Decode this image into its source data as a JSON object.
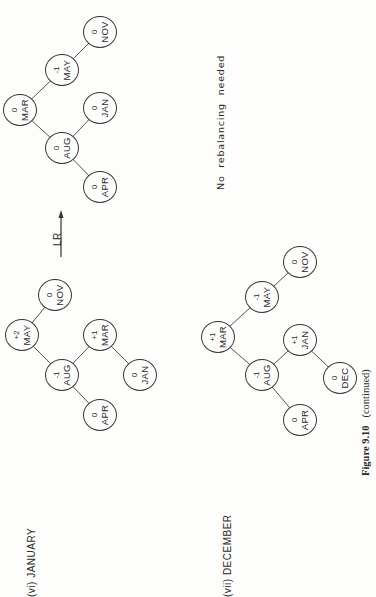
{
  "figure": {
    "caption_number": "Figure 9.10",
    "caption_text": "(continued)"
  },
  "sections": [
    {
      "label": "(vi) JANUARY",
      "tree_before": {
        "nodes": [
          {
            "key": "MAY",
            "balance": "+2"
          },
          {
            "key": "NOV",
            "balance": "0"
          },
          {
            "key": "AUG",
            "balance": "-1"
          },
          {
            "key": "MAR",
            "balance": "+1"
          },
          {
            "key": "APR",
            "balance": "0"
          },
          {
            "key": "JAN",
            "balance": "0"
          }
        ],
        "edges": [
          [
            "MAY",
            "AUG"
          ],
          [
            "MAY",
            "NOV"
          ],
          [
            "AUG",
            "APR"
          ],
          [
            "AUG",
            "MAR"
          ],
          [
            "MAR",
            "JAN"
          ]
        ]
      },
      "rotation": "LR",
      "tree_after": {
        "nodes": [
          {
            "key": "MAR",
            "balance": "0"
          },
          {
            "key": "MAY",
            "balance": "-1"
          },
          {
            "key": "NOV",
            "balance": "0"
          },
          {
            "key": "AUG",
            "balance": "0"
          },
          {
            "key": "JAN",
            "balance": "0"
          },
          {
            "key": "APR",
            "balance": "0"
          }
        ],
        "edges": [
          [
            "MAR",
            "AUG"
          ],
          [
            "MAR",
            "MAY"
          ],
          [
            "MAY",
            "NOV"
          ],
          [
            "AUG",
            "APR"
          ],
          [
            "AUG",
            "JAN"
          ]
        ]
      }
    },
    {
      "label": "(vii) DECEMBER",
      "tree": {
        "nodes": [
          {
            "key": "MAR",
            "balance": "+1"
          },
          {
            "key": "MAY",
            "balance": "-1"
          },
          {
            "key": "NOV",
            "balance": "0"
          },
          {
            "key": "AUG",
            "balance": "-1"
          },
          {
            "key": "JAN",
            "balance": "+1"
          },
          {
            "key": "APR",
            "balance": "0"
          },
          {
            "key": "DEC",
            "balance": "0"
          }
        ],
        "edges": [
          [
            "MAR",
            "AUG"
          ],
          [
            "MAR",
            "MAY"
          ],
          [
            "MAY",
            "NOV"
          ],
          [
            "AUG",
            "APR"
          ],
          [
            "AUG",
            "JAN"
          ],
          [
            "JAN",
            "DEC"
          ]
        ]
      },
      "note": "No rebalancing needed"
    }
  ]
}
